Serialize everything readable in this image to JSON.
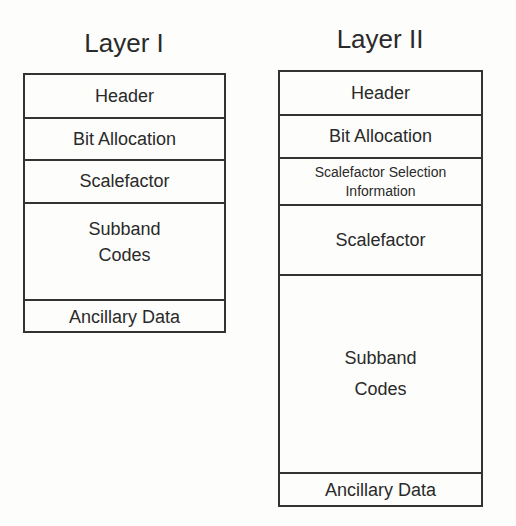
{
  "diagram": {
    "layer1": {
      "title": "Layer I",
      "cells": [
        "Header",
        "Bit Allocation",
        "Scalefactor",
        "Subband\nCodes",
        "Ancillary Data"
      ]
    },
    "layer2": {
      "title": "Layer II",
      "cells": [
        "Header",
        "Bit Allocation",
        "Scalefactor Selection\nInformation",
        "Scalefactor",
        "Subband\nCodes",
        "Ancillary Data"
      ]
    }
  }
}
